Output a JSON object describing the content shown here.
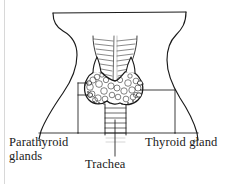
{
  "figure": {
    "style": "black ink line art on white background",
    "colors": {
      "ink": "#1a1a1a",
      "background": "#ffffff",
      "page_edge": "#d8d8d8"
    },
    "labels": {
      "parathyroid": {
        "line1": "Parathyroid",
        "line2": "glands"
      },
      "thyroid": "Thyroid gland",
      "trachea": "Trachea"
    },
    "structures": [
      "neck-outline",
      "thyroid-gland",
      "parathyroid-glands",
      "trachea",
      "larynx"
    ],
    "leader_lines": [
      "parathyroid-leader",
      "thyroid-leader",
      "trachea-leader"
    ]
  }
}
